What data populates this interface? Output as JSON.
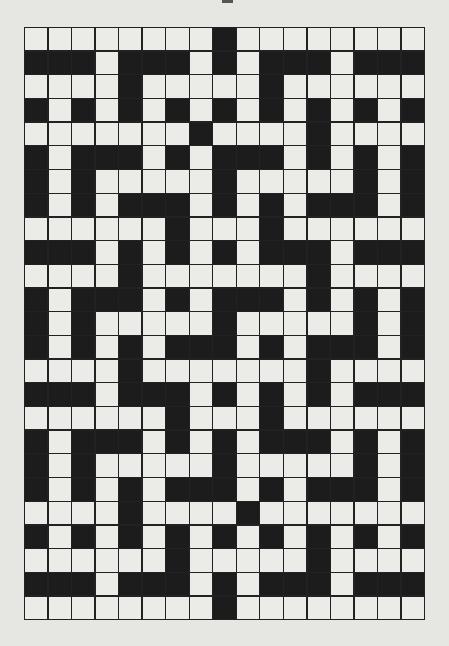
{
  "puzzle": {
    "type": "crossword",
    "cols": 17,
    "rows": 25,
    "colors": {
      "white": "#ebebe8",
      "black": "#1c1c1c",
      "background": "#e6e6e3"
    },
    "legend": "W = white (fillable) cell, B = black cell",
    "grid": [
      "WWWWWWWWBWWWWWWWW",
      "BBBWBBBWBWBBBWBBB",
      "WWWWBWWWWWBWWWWWW",
      "BWBWBWBWBWBWBWBWB",
      "WWWWWWWBWWWWBWWWW",
      "BWBBBWBWBBBWBWBWB",
      "BWBWWWWWBWWWWWBWB",
      "BWBWBBBWBWBWBBBWB",
      "WWWWWWBWWWBWWWWWW",
      "BBBWBWBWBWBBBWBBB",
      "WWWWBWWWWWWWBWWWW",
      "BWBBBWBWBBBWBWBWB",
      "BWBWWWWWBWWWWWBWB",
      "BWBWBWBBBWBWBBBWB",
      "WWWWBWWWWWWWBWWWW",
      "BBBWBBBWBWBWBWBBB",
      "WWWWWWBWWWBWWWWWW",
      "BWBBBWBWBWBBBWBWB",
      "BWBWWWWWBWWWWWBWB",
      "BWBWBWBBBWBWBBBWB",
      "WWWWBWWWWBWWWWWWW",
      "BWBWBWBWBWBWBWBWB",
      "WWWWWWBWWWWWBWWWW",
      "BBBWBBBWBWBBBWBBB",
      "WWWWWWWWBWWWWWWWW"
    ]
  }
}
